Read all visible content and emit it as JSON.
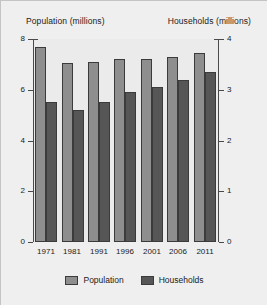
{
  "chart_data": {
    "type": "bar",
    "title": "",
    "categories": [
      "1971",
      "1981",
      "1991",
      "1996",
      "2001",
      "2006",
      "2011"
    ],
    "series": [
      {
        "name": "Population",
        "axis": "left",
        "color": "#8e8e8e",
        "values": [
          7.7,
          7.05,
          7.1,
          7.2,
          7.2,
          7.3,
          7.45
        ]
      },
      {
        "name": "Households",
        "axis": "right",
        "color": "#565656",
        "values": [
          2.75,
          2.6,
          2.75,
          2.95,
          3.05,
          3.2,
          3.35
        ]
      }
    ],
    "left_axis": {
      "label": "Population (millions)",
      "ticks": [
        "0",
        "2",
        "4",
        "6",
        "8"
      ],
      "tick_values": [
        0,
        2,
        4,
        6,
        8
      ],
      "ylim": [
        0,
        8
      ]
    },
    "right_axis": {
      "label": "Households (millions)",
      "ticks": [
        "0",
        "1",
        "2",
        "3",
        "4"
      ],
      "tick_values": [
        0,
        1,
        2,
        3,
        4
      ],
      "ylim": [
        0,
        4
      ]
    },
    "xlabel": "",
    "grid": false,
    "legend_position": "bottom",
    "legend": [
      "Population",
      "Households"
    ]
  }
}
